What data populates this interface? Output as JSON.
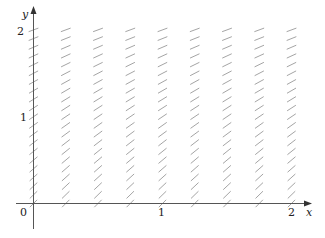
{
  "chart_data": {
    "type": "slope_field",
    "title": "",
    "xlabel": "x",
    "ylabel": "y",
    "xlim": [
      0,
      2
    ],
    "ylim": [
      0,
      2
    ],
    "x_ticks": [
      "0",
      "1",
      "2"
    ],
    "y_ticks": [
      "0",
      "1",
      "2"
    ],
    "grid": false,
    "x_samples": [
      0,
      0.25,
      0.5,
      0.75,
      1.0,
      1.25,
      1.5,
      1.75,
      2.0
    ],
    "y_samples": [
      0,
      0.1,
      0.2,
      0.3,
      0.4,
      0.5,
      0.6,
      0.7,
      0.8,
      0.9,
      1.0,
      1.1,
      1.2,
      1.3,
      1.4,
      1.5,
      1.6,
      1.7,
      1.8,
      1.9,
      2.0
    ],
    "slope_description": "slope depends only on y; steep (~1.5) near y=0, decreasing to ~0.55 near y=2",
    "slope_at_y": {
      "0": 1.5,
      "1": 1.0,
      "2": 0.55
    }
  },
  "axes": {
    "x_label": "x",
    "y_label": "y",
    "origin_label": "0",
    "x_tick_1": "1",
    "x_tick_2": "2",
    "y_tick_1": "1",
    "y_tick_2": "2"
  },
  "colors": {
    "axis": "#555555",
    "segment": "#9a9a9a",
    "text": "#222222"
  }
}
